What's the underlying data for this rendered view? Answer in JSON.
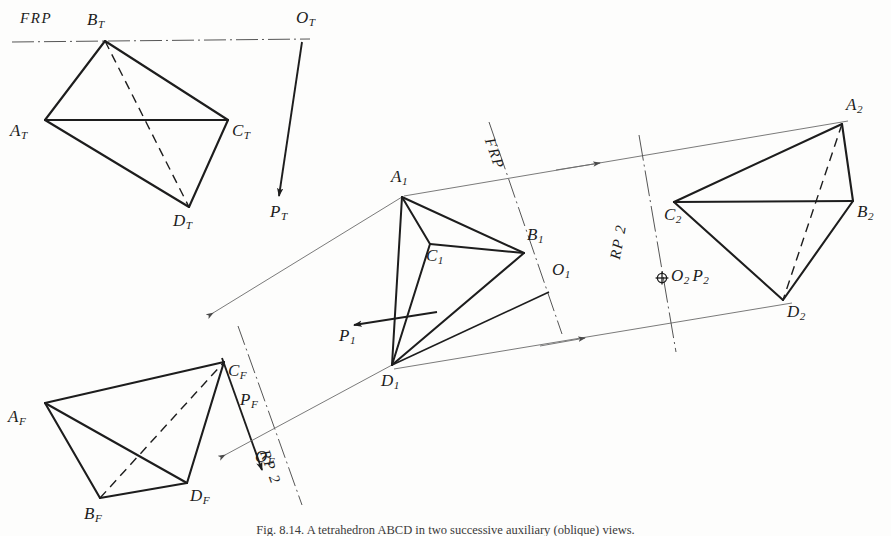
{
  "figure": {
    "caption": "Fig. 8.14. A tetrahedron ABCD in two successive auxiliary (oblique) views.",
    "background_color": "#fdfdfc",
    "ink_color": "#1d1d1d",
    "thin_ink_color": "#6b6b6b"
  },
  "views": {
    "top": {
      "name": "top-view",
      "vertices": [
        {
          "id": "A_T",
          "letter": "A",
          "sub": "T",
          "x": 45,
          "y": 120,
          "label_x": 10,
          "label_y": 122
        },
        {
          "id": "B_T",
          "letter": "B",
          "sub": "T",
          "x": 105,
          "y": 41,
          "label_x": 87,
          "label_y": 11
        },
        {
          "id": "C_T",
          "letter": "C",
          "sub": "T",
          "x": 228,
          "y": 120,
          "label_x": 232,
          "label_y": 122
        },
        {
          "id": "D_T",
          "letter": "D",
          "sub": "T",
          "x": 189,
          "y": 207,
          "label_x": 173,
          "label_y": 212
        }
      ],
      "solid_edges": [
        [
          "A_T",
          "B_T"
        ],
        [
          "B_T",
          "C_T"
        ],
        [
          "A_T",
          "C_T"
        ],
        [
          "A_T",
          "D_T"
        ],
        [
          "C_T",
          "D_T"
        ]
      ],
      "hidden_edges": [
        [
          "B_T",
          "D_T"
        ]
      ]
    },
    "front": {
      "name": "front-view",
      "vertices": [
        {
          "id": "A_F",
          "letter": "A",
          "sub": "F",
          "x": 45,
          "y": 403,
          "label_x": 8,
          "label_y": 408
        },
        {
          "id": "B_F",
          "letter": "B",
          "sub": "F",
          "x": 100,
          "y": 498,
          "label_x": 84,
          "label_y": 505
        },
        {
          "id": "C_F",
          "letter": "C",
          "sub": "F",
          "x": 224,
          "y": 362,
          "label_x": 228,
          "label_y": 363
        },
        {
          "id": "D_F",
          "letter": "D",
          "sub": "F",
          "x": 187,
          "y": 483,
          "label_x": 190,
          "label_y": 487
        }
      ],
      "solid_edges": [
        [
          "A_F",
          "C_F"
        ],
        [
          "A_F",
          "B_F"
        ],
        [
          "A_F",
          "D_F"
        ],
        [
          "B_F",
          "D_F"
        ],
        [
          "C_F",
          "D_F"
        ]
      ],
      "hidden_edges": [
        [
          "B_F",
          "C_F"
        ]
      ]
    },
    "aux1": {
      "name": "auxiliary-view-1",
      "vertices": [
        {
          "id": "A_1",
          "letter": "A",
          "sub": "1",
          "x": 402,
          "y": 197,
          "label_x": 391,
          "label_y": 170
        },
        {
          "id": "B_1",
          "letter": "B",
          "sub": "1",
          "x": 524,
          "y": 253,
          "label_x": 527,
          "label_y": 228
        },
        {
          "id": "C_1",
          "letter": "C",
          "sub": "1",
          "x": 430,
          "y": 244,
          "label_x": 428,
          "label_y": 248
        },
        {
          "id": "D_1",
          "letter": "D",
          "sub": "1",
          "x": 392,
          "y": 365,
          "label_x": 381,
          "label_y": 372
        }
      ],
      "solid_edges": [
        [
          "A_1",
          "B_1"
        ],
        [
          "A_1",
          "C_1"
        ],
        [
          "A_1",
          "D_1"
        ],
        [
          "C_1",
          "B_1"
        ],
        [
          "C_1",
          "D_1"
        ],
        [
          "D_1",
          "B_1"
        ]
      ],
      "hidden_edges": []
    },
    "aux2": {
      "name": "auxiliary-view-2",
      "vertices": [
        {
          "id": "A_2",
          "letter": "A",
          "sub": "2",
          "x": 842,
          "y": 124,
          "label_x": 846,
          "label_y": 98
        },
        {
          "id": "B_2",
          "letter": "B",
          "sub": "2",
          "x": 853,
          "y": 201,
          "label_x": 857,
          "label_y": 203
        },
        {
          "id": "C_2",
          "letter": "C",
          "sub": "2",
          "x": 674,
          "y": 202,
          "label_x": 668,
          "label_y": 206
        },
        {
          "id": "D_2",
          "letter": "D",
          "sub": "2",
          "x": 783,
          "y": 300,
          "label_x": 787,
          "label_y": 305
        }
      ],
      "solid_edges": [
        [
          "A_2",
          "B_2"
        ],
        [
          "A_2",
          "C_2"
        ],
        [
          "C_2",
          "B_2"
        ],
        [
          "C_2",
          "D_2"
        ],
        [
          "B_2",
          "D_2"
        ]
      ],
      "hidden_edges": [
        [
          "A_2",
          "D_2"
        ]
      ]
    }
  },
  "fold_lines": [
    {
      "id": "frp-top",
      "label": "FRP",
      "x1": 12,
      "y1": 42,
      "x2": 310,
      "y2": 39,
      "label_x": 22,
      "label_y": 12,
      "rotation": 0
    },
    {
      "id": "frp-aux1",
      "label": "FRP",
      "x1": 492,
      "y1": 128,
      "x2": 560,
      "y2": 330,
      "label_x": 497,
      "label_y": 134,
      "rotation": 70
    },
    {
      "id": "rp2-front",
      "label": "RP 2",
      "x1": 239,
      "y1": 328,
      "x2": 300,
      "y2": 500,
      "label_x": 274,
      "label_y": 452,
      "rotation": 70
    },
    {
      "id": "rp2-aux2",
      "label": "RP 2",
      "x1": 641,
      "y1": 140,
      "x2": 675,
      "y2": 345,
      "label_x": 614,
      "label_y": 225,
      "rotation": -80
    }
  ],
  "direction_marks": [
    {
      "id": "O_T",
      "letter": "O",
      "sub": "T",
      "x": 302,
      "y": 40,
      "label_x": 297,
      "label_y": 10
    },
    {
      "id": "P_T",
      "letter": "P",
      "sub": "T",
      "x": 278,
      "y": 202,
      "label_x": 272,
      "label_y": 205
    },
    {
      "id": "O_F",
      "letter": "O",
      "sub": "F",
      "x": 272,
      "y": 458,
      "label_x": 258,
      "label_y": 451
    },
    {
      "id": "P_F",
      "letter": "P",
      "sub": "F",
      "x": 260,
      "y": 412,
      "label_x": 244,
      "label_y": 392
    },
    {
      "id": "C_F_tick",
      "letter": "",
      "sub": "",
      "x": 0,
      "y": 0,
      "label_x": 0,
      "label_y": 0
    },
    {
      "id": "O_1",
      "letter": "O",
      "sub": "1",
      "x": 548,
      "y": 292,
      "label_x": 552,
      "label_y": 262
    },
    {
      "id": "P_1",
      "letter": "P",
      "sub": "1",
      "x": 356,
      "y": 327,
      "label_x": 342,
      "label_y": 329
    },
    {
      "id": "O2P2",
      "letter": "O",
      "sub": "2",
      "x": 662,
      "y": 278,
      "label_x": 671,
      "label_y": 268,
      "text2": "P",
      "sub2": "2"
    }
  ],
  "arrows": {
    "projection_direction": [
      {
        "id": "PT-arrow",
        "x1": 302,
        "y1": 42,
        "x2": 278,
        "y2": 198
      },
      {
        "id": "PF-arrow",
        "x1": 222,
        "y1": 363,
        "x2": 260,
        "y2": 470
      },
      {
        "id": "P1-arrow",
        "x1": 435,
        "y1": 313,
        "x2": 352,
        "y2": 325
      }
    ],
    "sight_lines": [
      {
        "id": "sight-top-to-aux1-upper",
        "x1": 235,
        "y1": 305,
        "x2": 402,
        "y2": 197
      },
      {
        "id": "sight-front-to-aux1-lower",
        "x1": 245,
        "y1": 443,
        "x2": 392,
        "y2": 365
      },
      {
        "id": "sight-aux1-to-aux2-upper",
        "x1": 410,
        "y1": 196,
        "x2": 846,
        "y2": 122
      },
      {
        "id": "sight-aux1-to-aux2-lower",
        "x1": 400,
        "y1": 368,
        "x2": 790,
        "y2": 303
      }
    ]
  }
}
